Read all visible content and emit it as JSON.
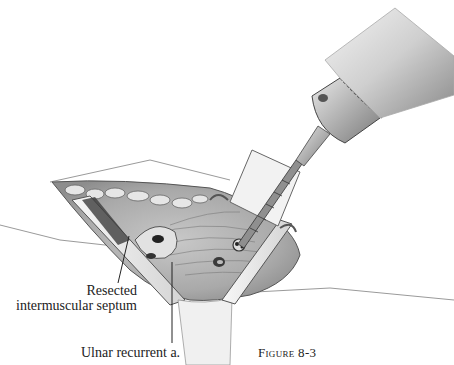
{
  "figure": {
    "caption_prefix": "Figure",
    "caption_number": "8-3"
  },
  "labels": {
    "septum_line1": "Resected",
    "septum_line2": "intermuscular septum",
    "ulnar": "Ulnar recurrent a."
  },
  "colors": {
    "background": "#ffffff",
    "ink": "#222222",
    "tissue_light": "#d9d9d9",
    "tissue_dark": "#6e6e6e",
    "metal": "#b5b5b5"
  }
}
